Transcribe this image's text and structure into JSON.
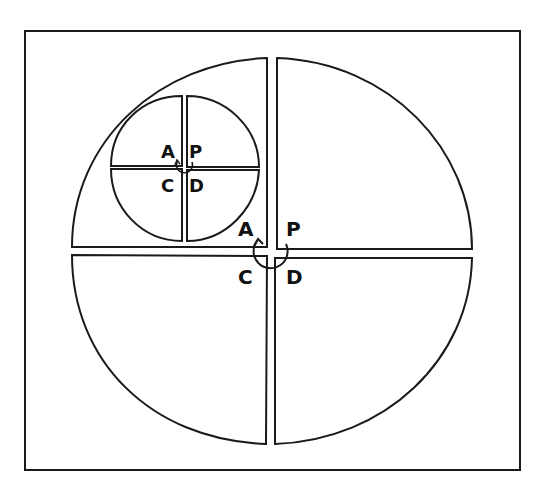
{
  "diagram": {
    "frame": {
      "x": 25,
      "y": 31,
      "width": 495,
      "height": 439,
      "stroke": "#1a1a1a"
    },
    "stroke_color": "#1a1a1a",
    "background": "#ffffff",
    "large_circle": {
      "quadrant_labels": {
        "top_left": "A",
        "top_right": "P",
        "bottom_left": "C",
        "bottom_right": "D"
      },
      "arrow": "counterclockwise-arc-from-P-to-A"
    },
    "small_circle": {
      "quadrant_labels": {
        "top_left": "A",
        "top_right": "P",
        "bottom_left": "C",
        "bottom_right": "D"
      },
      "arrow": "counterclockwise-arc-from-P-to-A"
    },
    "top_cropped_text": "· · · · · · · · · · · · ·"
  }
}
